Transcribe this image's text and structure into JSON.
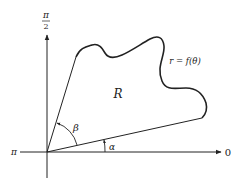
{
  "diagram": {
    "axis_labels": {
      "top_numerator": "π",
      "top_denominator": "2",
      "left": "π",
      "right": "0"
    },
    "region_label": "R",
    "curve_label": "r = f(θ)",
    "angle_labels": {
      "alpha": "α",
      "beta": "β"
    },
    "colors": {
      "stroke": "#222222",
      "background": "#ffffff"
    }
  }
}
